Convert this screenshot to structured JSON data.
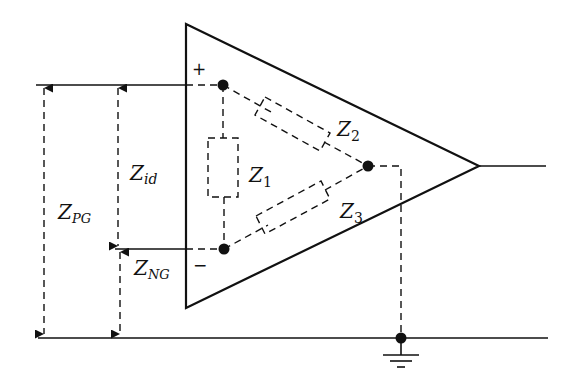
{
  "diagram": {
    "type": "op-amp input impedance model",
    "colors": {
      "stroke": "#111111",
      "background": "#ffffff"
    },
    "inputs": {
      "plus_symbol": "+",
      "minus_symbol": "−"
    },
    "impedances": [
      {
        "id": "Z1",
        "main": "Z",
        "sub": "1",
        "connects": [
          "+ node",
          "- node"
        ]
      },
      {
        "id": "Z2",
        "main": "Z",
        "sub": "2",
        "connects": [
          "+ node",
          "common node"
        ]
      },
      {
        "id": "Z3",
        "main": "Z",
        "sub": "3",
        "connects": [
          "- node",
          "common node"
        ]
      }
    ],
    "dimension_labels": [
      {
        "id": "Zid",
        "main": "Z",
        "sub": "id",
        "span": "between + and - input lines"
      },
      {
        "id": "ZPG",
        "main": "Z",
        "sub": "PG",
        "span": "between + input line and ground line"
      },
      {
        "id": "ZNG",
        "main": "Z",
        "sub": "NG",
        "span": "between - input line and ground line"
      }
    ],
    "ground": {
      "symbol": "ground-icon"
    }
  }
}
